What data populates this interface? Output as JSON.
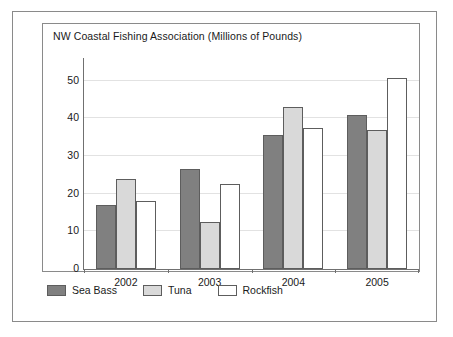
{
  "chart_data": {
    "type": "bar",
    "title": "NW Coastal Fishing Association (Millions of Pounds)",
    "xlabel": "",
    "ylabel": "",
    "categories": [
      "2002",
      "2003",
      "2004",
      "2005"
    ],
    "series": [
      {
        "name": "Sea Bass",
        "values": [
          17,
          26.5,
          35.5,
          40.8
        ],
        "color": "#808080"
      },
      {
        "name": "Tuna",
        "values": [
          24,
          12.5,
          43,
          37
        ],
        "color": "#d9d9d9"
      },
      {
        "name": "Rockfish",
        "values": [
          18,
          22.5,
          37.5,
          50.6
        ],
        "color": "#ffffff"
      }
    ],
    "ylim": [
      0,
      56
    ],
    "yticks": [
      0,
      10,
      20,
      30,
      40,
      50
    ],
    "ytick_labels": [
      "0",
      "10",
      "20",
      "30",
      "40",
      "50"
    ],
    "grid": true,
    "grid_axis": "y",
    "legend_position": "bottom-left",
    "bar_outline_color": "#5d5d5d",
    "axis_color": "#707070",
    "gridline_color": "#e2e2e2",
    "frame_color": "#8a8a8a",
    "background": "#ffffff"
  }
}
